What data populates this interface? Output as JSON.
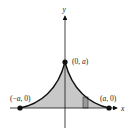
{
  "diagram": {
    "axes": {
      "x_label": "x",
      "y_label": "y"
    },
    "points": [
      {
        "id": "top",
        "label_open": "(0, ",
        "label_var": "a",
        "label_close": ")"
      },
      {
        "id": "left",
        "label_open": "(−",
        "label_var": "a",
        "label_close": ", 0)"
      },
      {
        "id": "right",
        "label_open": "(",
        "label_var": "a",
        "label_close": ", 0)"
      }
    ],
    "region": {
      "fill_color": "#c8c8c8",
      "curve_color": "#111111",
      "description": "Shaded region under concave-up cusp curve from (-a,0) to (a,0) with peak at (0,a)"
    },
    "representative_rectangle": {
      "fill_color": "#9a9a9a"
    }
  }
}
